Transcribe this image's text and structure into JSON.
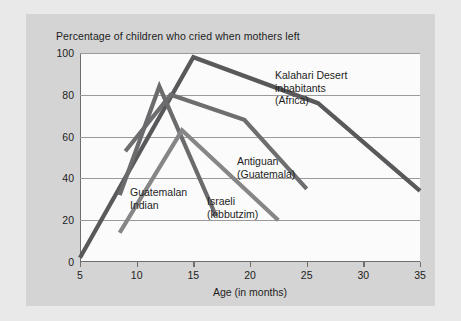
{
  "chart_data": {
    "type": "line",
    "title": "Percentage of children who cried when mothers left",
    "xlabel": "Age (in months)",
    "ylabel": "",
    "xlim": [
      5,
      35
    ],
    "ylim": [
      0,
      100
    ],
    "xticks": [
      "5",
      "10",
      "15",
      "20",
      "25",
      "30",
      "35"
    ],
    "yticks": [
      "0",
      "20",
      "40",
      "60",
      "80",
      "100"
    ],
    "grid": "horizontal",
    "legend_position": "inline-annotations",
    "series": [
      {
        "name": "Kalahari Desert inhabitants (Africa)",
        "color": "#59595b",
        "points": [
          {
            "x": 5,
            "y": 2
          },
          {
            "x": 15,
            "y": 98
          },
          {
            "x": 26,
            "y": 76
          },
          {
            "x": 35,
            "y": 34
          }
        ]
      },
      {
        "name": "Antiguan (Guatemala)",
        "color": "#6e6e70",
        "points": [
          {
            "x": 9,
            "y": 53
          },
          {
            "x": 13,
            "y": 80
          },
          {
            "x": 19.5,
            "y": 68
          },
          {
            "x": 25,
            "y": 35
          }
        ]
      },
      {
        "name": "Guatemalan Indian",
        "color": "#6b6b6d",
        "points": [
          {
            "x": 8.5,
            "y": 32
          },
          {
            "x": 12,
            "y": 84
          },
          {
            "x": 17,
            "y": 22
          }
        ]
      },
      {
        "name": "Israeli (kibbutzim)",
        "color": "#868688",
        "points": [
          {
            "x": 8.5,
            "y": 14
          },
          {
            "x": 14,
            "y": 63
          },
          {
            "x": 22.5,
            "y": 20
          }
        ]
      }
    ],
    "annotations": [
      {
        "id": "kalahari",
        "lines": [
          "Kalahari Desert",
          "inhabitants",
          "(Africa)"
        ]
      },
      {
        "id": "antiguan",
        "lines": [
          "Antiguan",
          "(Guatemala)"
        ]
      },
      {
        "id": "guatemalan",
        "lines": [
          "Guatemalan",
          "Indian"
        ]
      },
      {
        "id": "israeli",
        "lines": [
          "Israeli",
          "(kibbutzim)"
        ]
      }
    ]
  },
  "annotation_text": {
    "kalahari_line1": "Kalahari Desert",
    "kalahari_line2": "inhabitants",
    "kalahari_line3": "(Africa)",
    "antiguan_line1": "Antiguan",
    "antiguan_line2": "(Guatemala)",
    "guatemalan_line1": "Guatemalan",
    "guatemalan_line2": "Indian",
    "israeli_line1": "Israeli",
    "israeli_line2": "(kibbutzim)"
  },
  "colors": {
    "page_background": "#e9e9e9",
    "figure_background": "#d4d4d4",
    "plot_background": "#fbfbfb",
    "axis": "#6e6e6e",
    "gridline": "#9a9a9a",
    "text": "#1d1d1d"
  }
}
